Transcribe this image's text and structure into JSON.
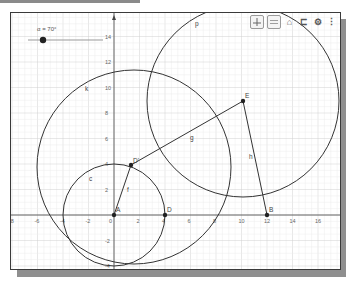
{
  "slider": {
    "label": "α = 70°",
    "name": "α",
    "value_deg": 70
  },
  "toolbar": {
    "graphics_view_icon": "graphics-grid-icon",
    "algebra_view_icon": "algebra-view-icon",
    "home_icon": "home-icon",
    "undo_icon": "undo-icon",
    "settings_icon": "gear-icon",
    "menu_icon": "more-vertical-icon",
    "home_glyph": "⌂",
    "undo_glyph": "⊏",
    "settings_glyph": "⚙",
    "menu_glyph": "⋮"
  },
  "axes": {
    "x_ticks": [
      "-8",
      "-6",
      "-4",
      "-2",
      "0",
      "2",
      "4",
      "6",
      "8",
      "10",
      "12",
      "14",
      "16"
    ],
    "y_ticks": [
      "14",
      "12",
      "10",
      "8",
      "6",
      "4",
      "2",
      "-2",
      "-4"
    ]
  },
  "points": [
    {
      "name": "A",
      "x": 0,
      "y": 0
    },
    {
      "name": "D",
      "x": 4,
      "y": 0
    },
    {
      "name": "D'",
      "x": 1.37,
      "y": 3.76
    },
    {
      "name": "E",
      "x": 10.1,
      "y": 8.9
    },
    {
      "name": "B",
      "x": 12,
      "y": 0
    }
  ],
  "objects": {
    "circle_c": "c",
    "circle_k": "k",
    "circle_p": "p",
    "segment_f": "f",
    "segment_g": "g",
    "segment_h": "h"
  },
  "labels": {
    "A": "A",
    "D": "D",
    "Dp": "D'",
    "E": "E",
    "B": "B"
  },
  "colors": {
    "curve": "#333333",
    "grid_major": "#d0d0d0",
    "grid_minor": "#ececec",
    "axis": "#444444"
  }
}
